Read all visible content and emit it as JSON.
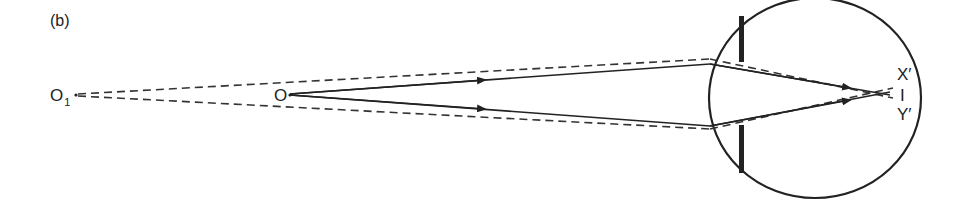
{
  "figure": {
    "panel_label": "(b)",
    "labels": {
      "far_object": "O",
      "far_object_subscript": "1",
      "near_object": "O",
      "image_top": "X′",
      "image_mid": "I",
      "image_bottom": "Y′"
    },
    "colors": {
      "ink": "#222222",
      "background": "#ffffff"
    }
  }
}
